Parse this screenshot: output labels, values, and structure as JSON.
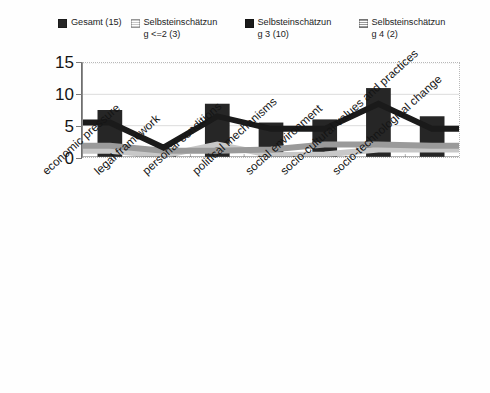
{
  "chart_data": {
    "type": "area",
    "title": "",
    "xlabel": "",
    "ylabel": "",
    "ylim": [
      0,
      15
    ],
    "yticks": [
      0,
      5,
      10,
      15
    ],
    "grid": true,
    "legend_position": "top",
    "categories": [
      "economic pressure",
      "legal framework",
      "personal conditions",
      "political mechanisms",
      "social environment",
      "socio-cultural values and practices",
      "socio-technological change"
    ],
    "series": [
      {
        "name": "Gesamt (15)",
        "legend_text": "Gesamt (15)",
        "color": "#262626",
        "style": "bar",
        "values": [
          7.5,
          0.3,
          8.5,
          5.5,
          6.0,
          11.0,
          6.5
        ]
      },
      {
        "name": "Selbsteinschätzung <=2 (3)",
        "legend_text": "Selbsteinschätzun\ng <=2 (3)",
        "color": "#c8c8c8",
        "style": "area",
        "values": [
          1.0,
          0.2,
          2.0,
          0.3,
          0.4,
          1.2,
          1.2
        ]
      },
      {
        "name": "Selbsteinschätzung 3 (10)",
        "legend_text": "Selbsteinschätzun\ng 3 (10)",
        "color": "#1a1a1a",
        "style": "area",
        "values": [
          5.5,
          1.5,
          6.5,
          4.5,
          4.5,
          8.5,
          4.5
        ]
      },
      {
        "name": "Selbsteinschätzung 4 (2)",
        "legend_text": "Selbsteinschätzun\ng 4 (2)",
        "color": "#9a9a9a",
        "style": "area",
        "values": [
          1.8,
          1.0,
          1.0,
          1.2,
          2.0,
          2.0,
          1.8
        ]
      }
    ]
  }
}
